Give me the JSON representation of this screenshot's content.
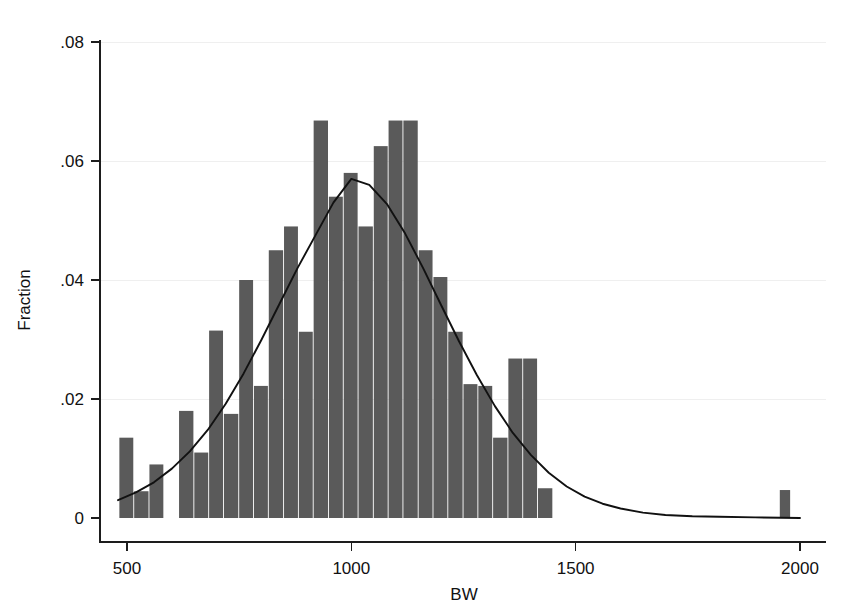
{
  "figure": {
    "background_color": "#ffffff",
    "bar_color": "#5a5a5a",
    "curve_color": "#111111",
    "axis_color": "#1d1d1d",
    "grid_color": "#efefef",
    "y_axis_title": "Fraction",
    "x_axis_title": "BW"
  },
  "chart_data": {
    "type": "bar",
    "title": "",
    "subtitle": "",
    "xlabel": "BW",
    "ylabel": "Fraction",
    "xlim": [
      460,
      2010
    ],
    "ylim": [
      0,
      0.08
    ],
    "xticks": [
      500,
      1000,
      1500,
      2000
    ],
    "xtick_labels": [
      "500",
      "1000",
      "1500",
      "2000"
    ],
    "yticks": [
      0,
      0.02,
      0.04,
      0.06,
      0.08
    ],
    "ytick_labels": [
      "0",
      ".02",
      ".04",
      ".06",
      ".08"
    ],
    "grid": "horizontal-faint",
    "legend": "none",
    "bin_width": 33.3,
    "bars": [
      {
        "x_left": 483,
        "x_right": 516,
        "center": 499,
        "value": 0.0135
      },
      {
        "x_left": 516,
        "x_right": 550,
        "center": 533,
        "value": 0.0045
      },
      {
        "x_left": 550,
        "x_right": 583,
        "center": 566,
        "value": 0.009
      },
      {
        "x_left": 616,
        "x_right": 650,
        "center": 633,
        "value": 0.018
      },
      {
        "x_left": 650,
        "x_right": 683,
        "center": 666,
        "value": 0.011
      },
      {
        "x_left": 683,
        "x_right": 716,
        "center": 699,
        "value": 0.0315
      },
      {
        "x_left": 716,
        "x_right": 750,
        "center": 733,
        "value": 0.0175
      },
      {
        "x_left": 750,
        "x_right": 783,
        "center": 766,
        "value": 0.04
      },
      {
        "x_left": 783,
        "x_right": 816,
        "center": 799,
        "value": 0.0222
      },
      {
        "x_left": 816,
        "x_right": 850,
        "center": 833,
        "value": 0.045
      },
      {
        "x_left": 850,
        "x_right": 883,
        "center": 866,
        "value": 0.049
      },
      {
        "x_left": 883,
        "x_right": 916,
        "center": 899,
        "value": 0.0313
      },
      {
        "x_left": 916,
        "x_right": 950,
        "center": 933,
        "value": 0.0668
      },
      {
        "x_left": 950,
        "x_right": 983,
        "center": 966,
        "value": 0.054
      },
      {
        "x_left": 983,
        "x_right": 1016,
        "center": 999,
        "value": 0.058
      },
      {
        "x_left": 1016,
        "x_right": 1050,
        "center": 1033,
        "value": 0.049
      },
      {
        "x_left": 1050,
        "x_right": 1083,
        "center": 1066,
        "value": 0.0625
      },
      {
        "x_left": 1083,
        "x_right": 1116,
        "center": 1099,
        "value": 0.0668
      },
      {
        "x_left": 1116,
        "x_right": 1150,
        "center": 1133,
        "value": 0.0668
      },
      {
        "x_left": 1150,
        "x_right": 1183,
        "center": 1166,
        "value": 0.045
      },
      {
        "x_left": 1183,
        "x_right": 1216,
        "center": 1199,
        "value": 0.0405
      },
      {
        "x_left": 1216,
        "x_right": 1250,
        "center": 1233,
        "value": 0.0313
      },
      {
        "x_left": 1250,
        "x_right": 1283,
        "center": 1266,
        "value": 0.0225
      },
      {
        "x_left": 1283,
        "x_right": 1316,
        "center": 1299,
        "value": 0.0222
      },
      {
        "x_left": 1316,
        "x_right": 1350,
        "center": 1333,
        "value": 0.0135
      },
      {
        "x_left": 1350,
        "x_right": 1383,
        "center": 1366,
        "value": 0.0268
      },
      {
        "x_left": 1383,
        "x_right": 1416,
        "center": 1399,
        "value": 0.0268
      },
      {
        "x_left": 1416,
        "x_right": 1450,
        "center": 1433,
        "value": 0.005
      },
      {
        "x_left": 1955,
        "x_right": 1980,
        "center": 1967,
        "value": 0.0047
      }
    ],
    "density_curve": {
      "name": "normal density overlay",
      "mean": 1000,
      "sd": 233,
      "peak_value": 0.057,
      "points": [
        {
          "x": 480,
          "y": 0.003
        },
        {
          "x": 520,
          "y": 0.0043
        },
        {
          "x": 560,
          "y": 0.006
        },
        {
          "x": 600,
          "y": 0.0083
        },
        {
          "x": 640,
          "y": 0.0112
        },
        {
          "x": 680,
          "y": 0.0148
        },
        {
          "x": 720,
          "y": 0.0192
        },
        {
          "x": 760,
          "y": 0.0243
        },
        {
          "x": 800,
          "y": 0.03
        },
        {
          "x": 840,
          "y": 0.036
        },
        {
          "x": 880,
          "y": 0.042
        },
        {
          "x": 920,
          "y": 0.0475
        },
        {
          "x": 960,
          "y": 0.053
        },
        {
          "x": 1000,
          "y": 0.057
        },
        {
          "x": 1040,
          "y": 0.056
        },
        {
          "x": 1080,
          "y": 0.0527
        },
        {
          "x": 1120,
          "y": 0.0478
        },
        {
          "x": 1160,
          "y": 0.042
        },
        {
          "x": 1200,
          "y": 0.0358
        },
        {
          "x": 1240,
          "y": 0.0297
        },
        {
          "x": 1280,
          "y": 0.024
        },
        {
          "x": 1320,
          "y": 0.0188
        },
        {
          "x": 1360,
          "y": 0.0143
        },
        {
          "x": 1400,
          "y": 0.0106
        },
        {
          "x": 1440,
          "y": 0.0076
        },
        {
          "x": 1480,
          "y": 0.0053
        },
        {
          "x": 1520,
          "y": 0.0036
        },
        {
          "x": 1560,
          "y": 0.0024
        },
        {
          "x": 1600,
          "y": 0.0016
        },
        {
          "x": 1650,
          "y": 0.0009
        },
        {
          "x": 1700,
          "y": 0.0005
        },
        {
          "x": 1760,
          "y": 0.0003
        },
        {
          "x": 1820,
          "y": 0.0002
        },
        {
          "x": 1900,
          "y": 0.0001
        },
        {
          "x": 2000,
          "y": 0.0
        }
      ]
    }
  }
}
